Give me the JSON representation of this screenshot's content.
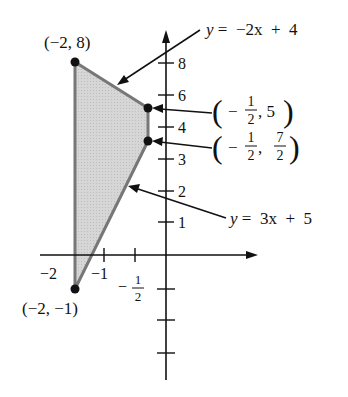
{
  "figure": {
    "type": "feasible-region",
    "vertices": [
      {
        "label": "(−2, 8)",
        "x": -2,
        "y": 8
      },
      {
        "label": "(−½, 5)",
        "x": -0.5,
        "y": 5
      },
      {
        "label": "(−½, 7/2)",
        "x": -0.5,
        "y": 3.5
      },
      {
        "label": "(−2, −1)",
        "x": -2,
        "y": -1
      }
    ],
    "lines": [
      {
        "equation": "y = −2x + 4",
        "lhs": "y",
        "rhs": "= −2x + 4"
      },
      {
        "equation": "y = 3x + 5",
        "lhs": "y",
        "rhs": "= 3x + 5"
      }
    ],
    "region_fill": "#d4d4d4",
    "region_edge": "#777777",
    "point_color": "#111111"
  },
  "axes": {
    "y_tick_labels": [
      "8",
      "6",
      "4",
      "3",
      "2",
      "1"
    ],
    "x_tick_labels": [
      "−2",
      "−1",
      "−"
    ],
    "x_half_num": "1",
    "x_half_den": "2"
  },
  "labels": {
    "p1": "(−2, 8)",
    "p4": "(−2, −1)",
    "p2_open": "(",
    "p2_minus": "−",
    "p2_num": "1",
    "p2_den": "2",
    "p2_rest": ", 5",
    "p2_close": ")",
    "p3_open": "(",
    "p3_minus": "−",
    "p3_num": "1",
    "p3_den": "2",
    "p3_comma": ",",
    "p3_num2": "7",
    "p3_den2": "2",
    "p3_close": ")",
    "line1_y": "y",
    "line1_rest": " =  −2x  +  4",
    "line2_y": "y",
    "line2_rest": " =  3x  +  5"
  }
}
